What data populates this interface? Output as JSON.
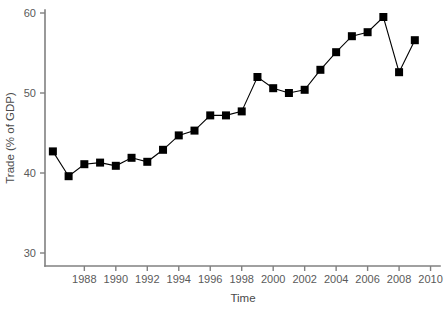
{
  "chart_data": {
    "type": "line",
    "title": "",
    "subtitle": "",
    "xlabel": "Time",
    "ylabel": "Trade (% of GDP)",
    "xlim": [
      1985.5,
      2010.6
    ],
    "ylim": [
      28.0,
      60.8
    ],
    "grid": false,
    "legend": null,
    "marker": "square",
    "line_color": "#000000",
    "marker_color": "#000000",
    "axis_color": "#808080",
    "x_ticks": [
      1988,
      1990,
      1992,
      1994,
      1996,
      1998,
      2000,
      2002,
      2004,
      2006,
      2008,
      2010
    ],
    "x_tick_labels": [
      "1988",
      "1990",
      "1992",
      "1994",
      "1996",
      "1998",
      "2000",
      "2002",
      "2004",
      "2006",
      "2008",
      "2010"
    ],
    "y_ticks": [
      30,
      40,
      50,
      60
    ],
    "y_tick_labels": [
      "30",
      "40",
      "50",
      "60"
    ],
    "x": [
      1986,
      1987,
      1988,
      1989,
      1990,
      1991,
      1992,
      1993,
      1994,
      1995,
      1996,
      1997,
      1998,
      1999,
      2000,
      2001,
      2002,
      2003,
      2004,
      2005,
      2006,
      2007,
      2008,
      2009
    ],
    "values": [
      42.7,
      39.6,
      41.1,
      41.3,
      40.9,
      41.9,
      41.4,
      42.9,
      44.7,
      45.3,
      47.2,
      47.2,
      47.7,
      52.0,
      50.6,
      50.0,
      50.4,
      52.9,
      55.1,
      57.1,
      57.6,
      59.5,
      52.6,
      56.6
    ],
    "series": [
      {
        "name": "Trade (% of GDP)",
        "values": [
          42.7,
          39.6,
          41.1,
          41.3,
          40.9,
          41.9,
          41.4,
          42.9,
          44.7,
          45.3,
          47.2,
          47.2,
          47.7,
          52.0,
          50.6,
          50.0,
          50.4,
          52.9,
          55.1,
          57.1,
          57.6,
          59.5,
          52.6,
          56.6
        ]
      }
    ]
  }
}
